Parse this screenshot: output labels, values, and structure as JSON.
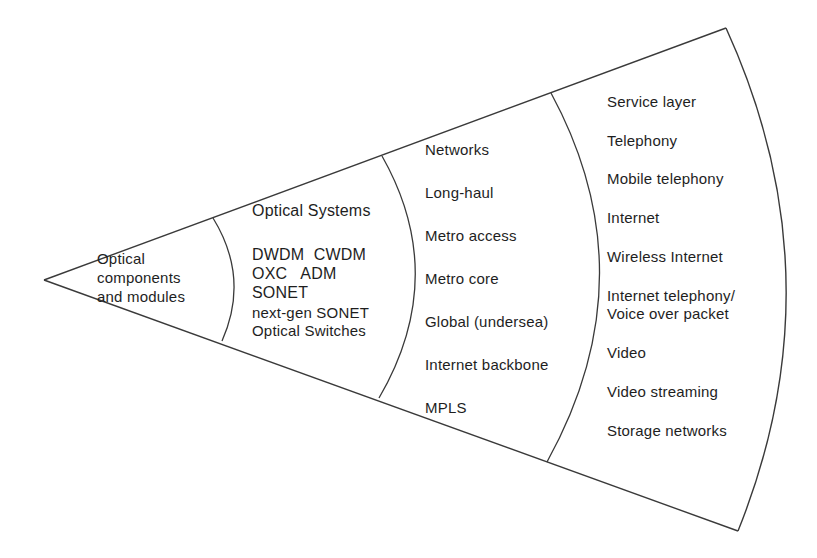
{
  "diagram": {
    "type": "wedge-layer-diagram",
    "layers": [
      {
        "id": "components",
        "title": "Optical components and modules",
        "lines": [
          "Optical",
          "components",
          "and modules"
        ]
      },
      {
        "id": "systems",
        "title": "Optical Systems",
        "lines": [
          "DWDM  CWDM",
          "OXC   ADM",
          "SONET",
          "next-gen SONET",
          "Optical Switches"
        ]
      },
      {
        "id": "networks",
        "title": "Networks",
        "lines": [
          "Long-haul",
          "Metro access",
          "Metro core",
          "Global (undersea)",
          "Internet backbone",
          "MPLS"
        ]
      },
      {
        "id": "service",
        "title": "Service layer",
        "lines": [
          "Telephony",
          "Mobile telephony",
          "Internet",
          "Wireless Internet",
          "Internet telephony/",
          "Voice over packet",
          "Video",
          "Video streaming",
          "Storage networks"
        ]
      }
    ],
    "line_color": "#3a3a3a"
  }
}
